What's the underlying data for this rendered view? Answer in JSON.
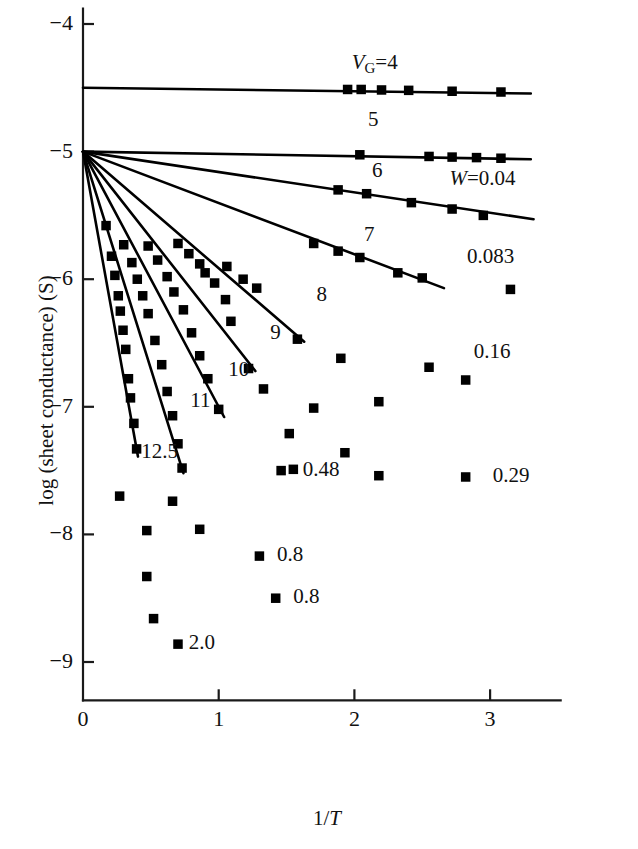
{
  "chart_data": {
    "type": "scatter",
    "title": "",
    "xlabel": "1/T",
    "ylabel": "log (sheet conductance) (S)",
    "xlim": [
      -0.18,
      3.55
    ],
    "ylim": [
      -9.45,
      -3.85
    ],
    "xticks": [
      0,
      1,
      2,
      3
    ],
    "xtick_labels": [
      "0",
      "1",
      "2",
      "3"
    ],
    "yticks": [
      -4,
      -5,
      -6,
      -7,
      -8,
      -9
    ],
    "ytick_labels": [
      "−4",
      "−5",
      "−6",
      "−7",
      "−8",
      "−9"
    ],
    "grid": false,
    "legend": "inline-annotations",
    "marker": "filled-square",
    "series": [
      {
        "name": "VG=4",
        "label": "V_G=4",
        "label_text": "V",
        "label_sub": "G",
        "label_tail": "=4",
        "label_x": 1.98,
        "label_y": -4.31,
        "fit": {
          "x0": 0.0,
          "y0": -4.5,
          "x1": 3.3,
          "y1": -4.545
        },
        "points": [
          {
            "x": 1.95,
            "y": -4.513
          },
          {
            "x": 2.05,
            "y": -4.513
          },
          {
            "x": 2.2,
            "y": -4.517
          },
          {
            "x": 2.4,
            "y": -4.52
          },
          {
            "x": 2.72,
            "y": -4.527
          },
          {
            "x": 3.08,
            "y": -4.533
          }
        ]
      },
      {
        "name": "5",
        "label": "5",
        "label_x": 2.1,
        "label_y": -4.76,
        "fit": {
          "x0": 0.0,
          "y0": -5.0,
          "x1": 3.3,
          "y1": -5.06
        },
        "points": [
          {
            "x": 2.04,
            "y": -5.025
          },
          {
            "x": 2.55,
            "y": -5.038
          },
          {
            "x": 2.72,
            "y": -5.043
          },
          {
            "x": 2.9,
            "y": -5.047
          },
          {
            "x": 3.08,
            "y": -5.052
          }
        ]
      },
      {
        "name": "6",
        "label": "6",
        "label_x": 2.13,
        "label_y": -5.16,
        "fit": {
          "x0": 0.0,
          "y0": -5.0,
          "x1": 3.32,
          "y1": -5.53
        },
        "points": [
          {
            "x": 1.88,
            "y": -5.3
          },
          {
            "x": 2.09,
            "y": -5.33
          },
          {
            "x": 2.42,
            "y": -5.4
          },
          {
            "x": 2.72,
            "y": -5.45
          },
          {
            "x": 2.95,
            "y": -5.5
          }
        ]
      },
      {
        "name": "7",
        "label": "7",
        "label_x": 2.07,
        "label_y": -5.66,
        "fit": {
          "x0": 0.0,
          "y0": -5.0,
          "x1": 2.66,
          "y1": -6.07
        },
        "points": [
          {
            "x": 1.7,
            "y": -5.72
          },
          {
            "x": 1.88,
            "y": -5.78
          },
          {
            "x": 2.04,
            "y": -5.83
          },
          {
            "x": 2.32,
            "y": -5.95
          },
          {
            "x": 2.5,
            "y": -5.99
          }
        ]
      },
      {
        "name": "8",
        "label": "8",
        "label_x": 1.72,
        "label_y": -6.13,
        "fit": {
          "x0": 0.0,
          "y0": -5.0,
          "x1": 1.63,
          "y1": -6.49
        },
        "points": [
          {
            "x": 1.06,
            "y": -5.9
          },
          {
            "x": 1.18,
            "y": -6.0
          },
          {
            "x": 1.28,
            "y": -6.07
          },
          {
            "x": 1.58,
            "y": -6.47
          }
        ]
      },
      {
        "name": "9",
        "label": "9",
        "label_x": 1.38,
        "label_y": -6.43,
        "fit": {
          "x0": 0.0,
          "y0": -5.0,
          "x1": 1.27,
          "y1": -6.72
        },
        "points": [
          {
            "x": 0.7,
            "y": -5.72
          },
          {
            "x": 0.78,
            "y": -5.8
          },
          {
            "x": 0.86,
            "y": -5.88
          },
          {
            "x": 0.9,
            "y": -5.95
          },
          {
            "x": 0.97,
            "y": -6.03
          },
          {
            "x": 1.05,
            "y": -6.16
          },
          {
            "x": 1.09,
            "y": -6.33
          },
          {
            "x": 1.22,
            "y": -6.7
          }
        ]
      },
      {
        "name": "10",
        "label": "10",
        "label_x": 1.07,
        "label_y": -6.72,
        "fit": {
          "x0": 0.0,
          "y0": -5.0,
          "x1": 1.04,
          "y1": -7.08
        },
        "points": [
          {
            "x": 0.48,
            "y": -5.74
          },
          {
            "x": 0.55,
            "y": -5.85
          },
          {
            "x": 0.62,
            "y": -5.98
          },
          {
            "x": 0.67,
            "y": -6.1
          },
          {
            "x": 0.74,
            "y": -6.24
          },
          {
            "x": 0.8,
            "y": -6.42
          },
          {
            "x": 0.86,
            "y": -6.6
          },
          {
            "x": 0.92,
            "y": -6.78
          },
          {
            "x": 1.0,
            "y": -7.02
          }
        ]
      },
      {
        "name": "11",
        "label": "11",
        "label_x": 0.79,
        "label_y": -6.96,
        "fit": {
          "x0": 0.0,
          "y0": -5.0,
          "x1": 0.74,
          "y1": -7.52
        },
        "points": [
          {
            "x": 0.3,
            "y": -5.73
          },
          {
            "x": 0.36,
            "y": -5.87
          },
          {
            "x": 0.4,
            "y": -6.0
          },
          {
            "x": 0.44,
            "y": -6.13
          },
          {
            "x": 0.48,
            "y": -6.27
          },
          {
            "x": 0.53,
            "y": -6.48
          },
          {
            "x": 0.58,
            "y": -6.67
          },
          {
            "x": 0.62,
            "y": -6.88
          },
          {
            "x": 0.66,
            "y": -7.07
          },
          {
            "x": 0.7,
            "y": -7.29
          },
          {
            "x": 0.73,
            "y": -7.48
          }
        ]
      },
      {
        "name": "12.5",
        "label": "12.5",
        "label_x": 0.43,
        "label_y": -7.36,
        "fit": {
          "x0": 0.0,
          "y0": -5.0,
          "x1": 0.405,
          "y1": -7.39
        },
        "points": [
          {
            "x": 0.17,
            "y": -5.58
          },
          {
            "x": 0.21,
            "y": -5.82
          },
          {
            "x": 0.235,
            "y": -5.97
          },
          {
            "x": 0.26,
            "y": -6.13
          },
          {
            "x": 0.275,
            "y": -6.25
          },
          {
            "x": 0.295,
            "y": -6.4
          },
          {
            "x": 0.315,
            "y": -6.55
          },
          {
            "x": 0.335,
            "y": -6.78
          },
          {
            "x": 0.35,
            "y": -6.93
          },
          {
            "x": 0.375,
            "y": -7.13
          },
          {
            "x": 0.395,
            "y": -7.33
          }
        ]
      }
    ],
    "w_annotations": [
      {
        "label": "W=0.04",
        "label_text": "W",
        "label_tail": "=0.04",
        "x": 2.7,
        "y": -5.22,
        "is_w": true
      },
      {
        "label": "0.083",
        "x": 2.83,
        "y": -5.83,
        "is_w": false
      },
      {
        "label": "0.16",
        "x": 2.88,
        "y": -6.58,
        "is_w": false
      },
      {
        "label": "0.29",
        "x": 3.02,
        "y": -7.55,
        "is_w": false
      },
      {
        "label": "0.48",
        "x": 1.62,
        "y": -7.5,
        "is_w": false
      },
      {
        "label": "0.8",
        "x": 1.43,
        "y": -8.17,
        "is_w": false
      },
      {
        "label": "0.8",
        "x": 1.55,
        "y": -8.5,
        "is_w": false
      },
      {
        "label": "2.0",
        "x": 0.78,
        "y": -8.86,
        "is_w": false
      }
    ],
    "loose_points": [
      {
        "x": 3.15,
        "y": -6.08
      },
      {
        "x": 2.55,
        "y": -6.69
      },
      {
        "x": 2.82,
        "y": -6.79
      },
      {
        "x": 1.9,
        "y": -6.62
      },
      {
        "x": 2.18,
        "y": -6.96
      },
      {
        "x": 1.7,
        "y": -7.01
      },
      {
        "x": 1.33,
        "y": -6.86
      },
      {
        "x": 1.52,
        "y": -7.21
      },
      {
        "x": 1.93,
        "y": -7.36
      },
      {
        "x": 1.55,
        "y": -7.49
      },
      {
        "x": 2.18,
        "y": -7.54
      },
      {
        "x": 2.82,
        "y": -7.55
      },
      {
        "x": 1.46,
        "y": -7.5
      },
      {
        "x": 0.27,
        "y": -7.7
      },
      {
        "x": 0.66,
        "y": -7.74
      },
      {
        "x": 0.47,
        "y": -7.97
      },
      {
        "x": 0.86,
        "y": -7.96
      },
      {
        "x": 0.47,
        "y": -8.33
      },
      {
        "x": 1.3,
        "y": -8.17
      },
      {
        "x": 0.52,
        "y": -8.66
      },
      {
        "x": 1.42,
        "y": -8.5
      },
      {
        "x": 0.7,
        "y": -8.86
      }
    ]
  },
  "axis": {
    "x_title": "1/T",
    "x_title_numerator": "1/",
    "x_title_var": "T",
    "y_title": "log (sheet conductance) (S)"
  }
}
